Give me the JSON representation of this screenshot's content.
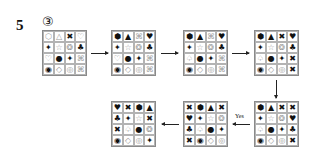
{
  "question_number": "5",
  "option_label": "③",
  "arrow_label": "Yes",
  "symbols": {
    "hex_outline": "⬡",
    "hex_filled": "⬢",
    "triangle_outline": "△",
    "triangle_filled": "▲",
    "x_bold": "✖",
    "x_outline": "⌘",
    "heart_outline": "♡",
    "heart_filled": "♥",
    "cross_star": "✦",
    "star_outline": "☆",
    "gear_outline": "❂",
    "clover_filled": "♣",
    "circle_filled": "●",
    "ring_bold": "◉",
    "diamond_outline": "◇",
    "circle_outline": "◎",
    "spade_outline": "♤"
  },
  "grids": [
    {
      "name": "grid-1",
      "cells": [
        [
          "⬡",
          "o"
        ],
        [
          "△",
          "o"
        ],
        [
          "✖",
          "f"
        ],
        [
          "♡",
          "o"
        ],
        [
          "✦",
          "f"
        ],
        [
          "☆",
          "o"
        ],
        [
          "❂",
          "o"
        ],
        [
          "♣",
          "f"
        ],
        [
          "♡",
          "o"
        ],
        [
          "●",
          "f"
        ],
        [
          "✦",
          "f"
        ],
        [
          "⌘",
          "o"
        ],
        [
          "◉",
          "f"
        ],
        [
          "◇",
          "o"
        ],
        [
          "◎",
          "o"
        ],
        [
          "⌘",
          "o"
        ]
      ]
    },
    {
      "name": "grid-2",
      "cells": [
        [
          "⬢",
          "f"
        ],
        [
          "▲",
          "f"
        ],
        [
          "⌘",
          "o"
        ],
        [
          "♥",
          "f"
        ],
        [
          "✦",
          "f"
        ],
        [
          "☆",
          "o"
        ],
        [
          "❂",
          "o"
        ],
        [
          "♣",
          "f"
        ],
        [
          "♡",
          "o"
        ],
        [
          "●",
          "f"
        ],
        [
          "✦",
          "f"
        ],
        [
          "⌘",
          "o"
        ],
        [
          "◉",
          "f"
        ],
        [
          "◇",
          "o"
        ],
        [
          "◎",
          "o"
        ],
        [
          "⌘",
          "o"
        ]
      ]
    },
    {
      "name": "grid-3",
      "cells": [
        [
          "⬢",
          "f"
        ],
        [
          "▲",
          "f"
        ],
        [
          "⌘",
          "o"
        ],
        [
          "♥",
          "f"
        ],
        [
          "✦",
          "f"
        ],
        [
          "☆",
          "o"
        ],
        [
          "❂",
          "o"
        ],
        [
          "♣",
          "f"
        ],
        [
          "♤",
          "o"
        ],
        [
          "●",
          "f"
        ],
        [
          "✦",
          "f"
        ],
        [
          "⌘",
          "o"
        ],
        [
          "◉",
          "f"
        ],
        [
          "◇",
          "o"
        ],
        [
          "◎",
          "o"
        ],
        [
          "⌘",
          "o"
        ]
      ]
    },
    {
      "name": "grid-4",
      "cells": [
        [
          "⬢",
          "f"
        ],
        [
          "▲",
          "f"
        ],
        [
          "✖",
          "f"
        ],
        [
          "♥",
          "f"
        ],
        [
          "✦",
          "f"
        ],
        [
          "☆",
          "o"
        ],
        [
          "❂",
          "o"
        ],
        [
          "♣",
          "f"
        ],
        [
          "♤",
          "o"
        ],
        [
          "●",
          "f"
        ],
        [
          "✦",
          "f"
        ],
        [
          "✖",
          "f"
        ],
        [
          "◉",
          "f"
        ],
        [
          "◇",
          "o"
        ],
        [
          "◎",
          "o"
        ],
        [
          "✖",
          "f"
        ]
      ]
    },
    {
      "name": "grid-5",
      "cells": [
        [
          "⬢",
          "f"
        ],
        [
          "▲",
          "f"
        ],
        [
          "✖",
          "f"
        ],
        [
          "✖",
          "f"
        ],
        [
          "✦",
          "f"
        ],
        [
          "☆",
          "o"
        ],
        [
          "❂",
          "o"
        ],
        [
          "♥",
          "f"
        ],
        [
          "♤",
          "o"
        ],
        [
          "●",
          "f"
        ],
        [
          "✦",
          "f"
        ],
        [
          "♣",
          "f"
        ],
        [
          "◉",
          "f"
        ],
        [
          "◇",
          "o"
        ],
        [
          "◎",
          "o"
        ],
        [
          "✖",
          "f"
        ]
      ]
    },
    {
      "name": "grid-6",
      "cells": [
        [
          "✖",
          "f"
        ],
        [
          "⬢",
          "f"
        ],
        [
          "▲",
          "f"
        ],
        [
          "✖",
          "f"
        ],
        [
          "♥",
          "f"
        ],
        [
          "✦",
          "f"
        ],
        [
          "☆",
          "o"
        ],
        [
          "❂",
          "o"
        ],
        [
          "♣",
          "f"
        ],
        [
          "♤",
          "o"
        ],
        [
          "●",
          "f"
        ],
        [
          "✦",
          "f"
        ],
        [
          "✖",
          "f"
        ],
        [
          "◉",
          "f"
        ],
        [
          "◇",
          "o"
        ],
        [
          "◎",
          "o"
        ]
      ]
    },
    {
      "name": "grid-7",
      "cells": [
        [
          "♥",
          "f"
        ],
        [
          "✖",
          "f"
        ],
        [
          "⬢",
          "f"
        ],
        [
          "▲",
          "f"
        ],
        [
          "♣",
          "f"
        ],
        [
          "✦",
          "f"
        ],
        [
          "☆",
          "o"
        ],
        [
          "✖",
          "f"
        ],
        [
          "✖",
          "f"
        ],
        [
          "♤",
          "o"
        ],
        [
          "●",
          "f"
        ],
        [
          "❂",
          "o"
        ],
        [
          "◉",
          "f"
        ],
        [
          "◇",
          "o"
        ],
        [
          "◎",
          "o"
        ],
        [
          "✦",
          "f"
        ]
      ]
    }
  ]
}
